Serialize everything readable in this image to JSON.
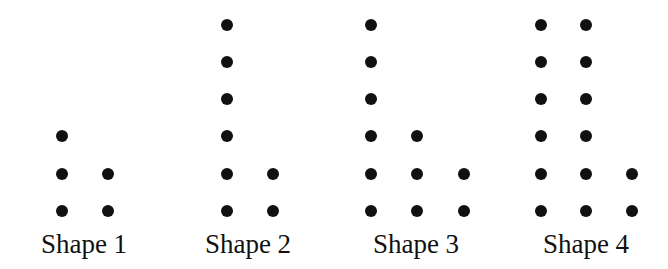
{
  "figure": {
    "dot_color": "#111111",
    "background": "#ffffff",
    "row_y": [
      25,
      62,
      99,
      136,
      174,
      211
    ],
    "shapes": [
      {
        "label": "Shape 1",
        "label_center_x": 84,
        "dot_count": 5,
        "columns": [
          {
            "x": 62,
            "heights": 3
          },
          {
            "x": 108,
            "heights": 2
          }
        ]
      },
      {
        "label": "Shape 2",
        "label_center_x": 248,
        "dot_count": 8,
        "columns": [
          {
            "x": 227,
            "heights": 6
          },
          {
            "x": 273,
            "heights": 2
          }
        ]
      },
      {
        "label": "Shape 3",
        "label_center_x": 416,
        "dot_count": 11,
        "columns": [
          {
            "x": 371,
            "heights": 6
          },
          {
            "x": 417,
            "heights": 3
          },
          {
            "x": 464,
            "heights": 2
          }
        ]
      },
      {
        "label": "Shape 4",
        "label_center_x": 586,
        "dot_count": 14,
        "columns": [
          {
            "x": 541,
            "heights": 6
          },
          {
            "x": 586,
            "heights": 6
          },
          {
            "x": 632,
            "heights": 2
          }
        ]
      }
    ]
  }
}
